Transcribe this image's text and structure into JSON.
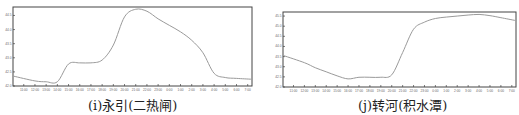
{
  "chart_data": [
    {
      "type": "line",
      "title": "(i)永引(二热闸)",
      "xlabel": "",
      "ylabel": "",
      "grid": false,
      "legend": null,
      "x": [
        "11:00",
        "12:00",
        "13:00",
        "14:00",
        "15:00",
        "16:00",
        "17:00",
        "18:00",
        "19:00",
        "20:00",
        "21:00",
        "22:00",
        "23:00",
        "0:00",
        "1:00",
        "2:00",
        "3:00",
        "4:00",
        "5:00",
        "6:00",
        "7:00"
      ],
      "y_ticks": [
        "42.0",
        "42.5",
        "43.0",
        "43.5",
        "44.0",
        "44.5"
      ],
      "ylim": [
        42.0,
        44.8
      ],
      "series": [
        {
          "name": "water level",
          "values": [
            42.35,
            42.18,
            42.15,
            42.15,
            42.78,
            42.82,
            42.82,
            42.92,
            43.45,
            44.45,
            44.72,
            44.65,
            44.38,
            44.15,
            43.92,
            43.62,
            43.18,
            42.45,
            42.3,
            42.27,
            42.24
          ]
        }
      ]
    },
    {
      "type": "line",
      "title": "(j)转河(积水潭)",
      "xlabel": "",
      "ylabel": "",
      "grid": false,
      "legend": null,
      "x": [
        "11:00",
        "12:00",
        "13:00",
        "14:00",
        "15:00",
        "16:00",
        "17:00",
        "18:00",
        "19:00",
        "20:00",
        "21:00",
        "22:00",
        "23:00",
        "0:00",
        "1:00",
        "2:00",
        "3:00",
        "4:00",
        "5:00",
        "6:00",
        "7:00"
      ],
      "y_ticks": [
        "42.0",
        "42.5",
        "43.0",
        "43.5",
        "44.0",
        "44.5",
        "45.0",
        "45.5"
      ],
      "ylim": [
        42.0,
        45.7
      ],
      "series": [
        {
          "name": "water level",
          "values": [
            43.55,
            43.2,
            42.95,
            42.75,
            42.55,
            42.4,
            42.48,
            42.48,
            42.48,
            42.6,
            43.7,
            44.85,
            45.2,
            45.38,
            45.45,
            45.5,
            45.55,
            45.58,
            45.52,
            45.42,
            45.28
          ]
        }
      ]
    }
  ],
  "captions": {
    "left": "(i)永引(二热闸)",
    "right": "(j)转河(积水潭)"
  },
  "colors": {
    "line": "#9a9a9a",
    "axis": "#444444",
    "caption": "#222222"
  }
}
